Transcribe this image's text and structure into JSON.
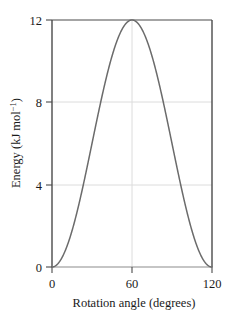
{
  "chart_data": {
    "type": "line",
    "title": "",
    "subtitle": "",
    "xlabel": "Rotation angle (degrees)",
    "ylabel_parts": {
      "main": "Energy (kJ mol",
      "superscript": "−1",
      "tail": ")"
    },
    "ylabel": "Energy (kJ mol⁻¹)",
    "xlim": [
      0,
      120
    ],
    "ylim": [
      0,
      12
    ],
    "xticks": [
      0,
      60,
      120
    ],
    "xtick_labels": [
      "0",
      "60",
      "120"
    ],
    "yticks": [
      0,
      4,
      8,
      12
    ],
    "ytick_labels": [
      "0",
      "4",
      "8",
      "12"
    ],
    "grid": true,
    "grid_axes": "both",
    "legend": "none",
    "equation": "E = 6(1 - cos(3*theta))",
    "peak": {
      "x": 60,
      "y": 12
    },
    "minima": [
      {
        "x": 0,
        "y": 0
      },
      {
        "x": 120,
        "y": 0
      }
    ],
    "series": [
      {
        "name": "torsional potential",
        "color": "#6b6b6b",
        "x": [
          0,
          3,
          6,
          9,
          12,
          15,
          18,
          21,
          24,
          27,
          30,
          33,
          36,
          39,
          42,
          45,
          48,
          51,
          54,
          57,
          60,
          63,
          66,
          69,
          72,
          75,
          78,
          81,
          84,
          87,
          90,
          93,
          96,
          99,
          102,
          105,
          108,
          111,
          114,
          117,
          120
        ],
        "y": [
          0.0,
          0.08,
          0.33,
          0.73,
          1.27,
          1.93,
          2.68,
          3.51,
          4.38,
          5.27,
          6.15,
          7.0,
          7.79,
          8.51,
          9.14,
          9.66,
          10.08,
          10.37,
          10.55,
          10.6,
          12.0,
          10.6,
          10.55,
          10.37,
          10.08,
          9.66,
          9.14,
          8.51,
          7.79,
          7.0,
          6.15,
          5.27,
          4.38,
          3.51,
          2.68,
          1.93,
          1.27,
          0.73,
          0.33,
          0.08,
          0.0
        ]
      }
    ]
  },
  "colors": {
    "curve": "#6b6b6b",
    "axis": "#4a4a4a",
    "grid": "#d9d9d9",
    "text": "#1a1a1a",
    "background": "#ffffff"
  }
}
